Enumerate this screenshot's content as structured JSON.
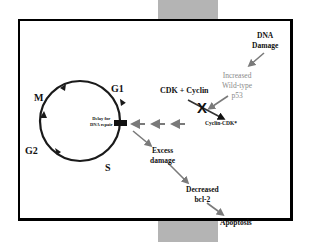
{
  "diagram": {
    "cell_cycle": {
      "phases": [
        {
          "label": "G1"
        },
        {
          "label": "S"
        },
        {
          "label": "G2"
        },
        {
          "label": "M"
        }
      ],
      "checkpoint_label_line1": "Delay for",
      "checkpoint_label_line2": "DNA repair"
    },
    "pathway": {
      "dna_damage_line1": "DNA",
      "dna_damage_line2": "Damage",
      "p53_line1": "Increased",
      "p53_line2": "Wild-type",
      "p53_line3": "p53",
      "cdk_cyclin": "CDK + Cyclin",
      "inhibition_mark": "X",
      "cyclin_cdk_star": "Cyclin-CDK*",
      "excess_damage_line1": "Excess",
      "excess_damage_line2": "damage",
      "decreased_bcl2_line1": "Decreased",
      "decreased_bcl2_line2": "bcl-2",
      "apoptosis": "Apoptosis"
    },
    "colors": {
      "border": "#000000",
      "arrow_gray": "#7a7a7a",
      "text_gray": "#8a8a8a",
      "bar_gray": "#b4b4b4"
    }
  }
}
